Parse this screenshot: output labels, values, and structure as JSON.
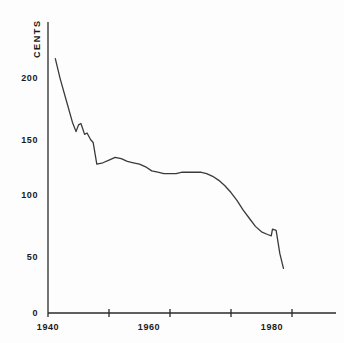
{
  "chart_data": {
    "type": "line",
    "title": "",
    "subtitle": "",
    "xlabel": "",
    "ylabel": "CENTS",
    "xlim": [
      1940,
      1987
    ],
    "ylim": [
      0,
      215
    ],
    "grid": false,
    "legend": "none",
    "axis_color": "#2a2a2a",
    "line_color": "#3a3a3a",
    "x_ticks": [
      1940,
      1950,
      1960,
      1970,
      1980
    ],
    "x_tick_labels": [
      "1940",
      "",
      "1960",
      "",
      "1980"
    ],
    "y_ticks": [
      0,
      50,
      100,
      150,
      200
    ],
    "y_tick_labels": [
      "0",
      "50",
      "100",
      "150",
      "200"
    ],
    "series": [
      {
        "name": "cents",
        "x": [
          1941.2,
          1942.0,
          1943.0,
          1944.0,
          1944.6,
          1945.0,
          1945.4,
          1946.0,
          1946.4,
          1947.0,
          1947.4,
          1948.0,
          1949.0,
          1950.0,
          1951.0,
          1952.0,
          1953.0,
          1954.0,
          1955.0,
          1956.0,
          1957.0,
          1958.0,
          1959.0,
          1960.0,
          1961.0,
          1962.0,
          1963.0,
          1964.0,
          1965.0,
          1966.0,
          1967.0,
          1968.0,
          1969.0,
          1970.0,
          1971.0,
          1972.0,
          1973.0,
          1974.0,
          1975.0,
          1976.0,
          1976.6,
          1976.8,
          1977.4,
          1978.0,
          1978.6
        ],
        "y": [
          188,
          173,
          157,
          141,
          134,
          139,
          140,
          132,
          133,
          128,
          126,
          110,
          111,
          113,
          115,
          114,
          112,
          111,
          110,
          108,
          105,
          104,
          103,
          103,
          103,
          104,
          104,
          104,
          104,
          103,
          101,
          98,
          94,
          89,
          83,
          76,
          70,
          64,
          60,
          58,
          57,
          62,
          61,
          44,
          33
        ]
      }
    ]
  },
  "geometry": {
    "plot_left": 48,
    "plot_right": 336,
    "plot_top": 22,
    "plot_bottom": 313,
    "x_per_year": 6.1,
    "y_axis_top_value": 215
  }
}
